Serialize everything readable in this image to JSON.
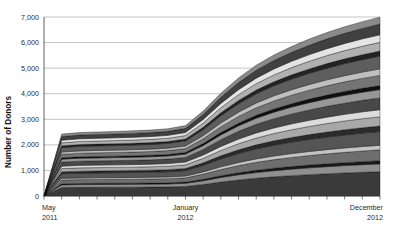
{
  "chart_data": {
    "type": "area",
    "title": "",
    "subtitle": "",
    "xlabel": "",
    "ylabel": "Number of Donors",
    "stacked": true,
    "grid": true,
    "legend": "none",
    "ylim": [
      0,
      7000
    ],
    "yticks": [
      0,
      1000,
      2000,
      3000,
      4000,
      5000,
      6000,
      7000
    ],
    "ytick_labels": [
      "0",
      "1,000",
      "2,000",
      "3,000",
      "4,000",
      "5,000",
      "6,000",
      "7,000"
    ],
    "x": [
      0,
      1,
      2,
      3,
      4,
      5,
      6,
      7,
      8,
      9,
      10,
      11,
      12,
      13,
      14,
      15,
      16,
      17,
      18,
      19
    ],
    "xtick_count": 20,
    "xtick_labels": [
      {
        "index": 0,
        "line1": "May",
        "line2": "2011"
      },
      {
        "index": 8,
        "line1": "January",
        "line2": "2012"
      },
      {
        "index": 19,
        "line1": "December",
        "line2": "2012"
      }
    ],
    "totals": [
      0,
      2320,
      2380,
      2400,
      2420,
      2440,
      2470,
      2520,
      2640,
      3180,
      3850,
      4420,
      4900,
      5280,
      5600,
      5880,
      6120,
      6340,
      6530,
      6700
    ],
    "series": [
      {
        "name": "series-01",
        "color": "#3a3a3a",
        "values": [
          0,
          330,
          338,
          341,
          344,
          347,
          351,
          358,
          375,
          452,
          547,
          628,
          696,
          750,
          796,
          835,
          870,
          901,
          928,
          952
        ]
      },
      {
        "name": "series-02",
        "color": "#8f8f8f",
        "values": [
          0,
          105,
          108,
          109,
          110,
          111,
          112,
          114,
          120,
          144,
          175,
          201,
          222,
          240,
          254,
          267,
          278,
          288,
          297,
          304
        ]
      },
      {
        "name": "series-03",
        "color": "#1a1a1a",
        "values": [
          0,
          42,
          43,
          44,
          44,
          44,
          45,
          46,
          48,
          58,
          70,
          80,
          89,
          96,
          102,
          107,
          111,
          115,
          119,
          122
        ]
      },
      {
        "name": "series-04",
        "color": "#6e6e6e",
        "values": [
          0,
          148,
          152,
          153,
          154,
          156,
          158,
          161,
          168,
          203,
          245,
          282,
          312,
          337,
          357,
          375,
          390,
          404,
          416,
          427
        ]
      },
      {
        "name": "series-05",
        "color": "#c4c4c4",
        "values": [
          0,
          62,
          63,
          64,
          65,
          65,
          66,
          67,
          70,
          85,
          103,
          118,
          131,
          141,
          150,
          157,
          164,
          170,
          175,
          179
        ]
      },
      {
        "name": "series-06",
        "color": "#555555",
        "values": [
          0,
          186,
          191,
          192,
          194,
          196,
          198,
          202,
          212,
          255,
          309,
          355,
          393,
          424,
          449,
          472,
          491,
          509,
          524,
          538
        ]
      },
      {
        "name": "series-07",
        "color": "#2b2b2b",
        "values": [
          0,
          74,
          76,
          77,
          77,
          78,
          79,
          81,
          84,
          102,
          123,
          141,
          157,
          169,
          179,
          188,
          196,
          203,
          209,
          214
        ]
      },
      {
        "name": "series-08",
        "color": "#a8a8a8",
        "values": [
          0,
          126,
          129,
          130,
          131,
          132,
          134,
          137,
          143,
          173,
          209,
          240,
          266,
          287,
          304,
          319,
          333,
          344,
          355,
          364
        ]
      },
      {
        "name": "series-09",
        "color": "#dcdcdc",
        "values": [
          0,
          95,
          98,
          98,
          99,
          100,
          101,
          103,
          108,
          130,
          158,
          181,
          201,
          216,
          230,
          241,
          251,
          260,
          268,
          275
        ]
      },
      {
        "name": "series-10",
        "color": "#484848",
        "values": [
          0,
          160,
          164,
          166,
          167,
          168,
          171,
          174,
          182,
          219,
          265,
          305,
          338,
          364,
          386,
          405,
          422,
          437,
          450,
          462
        ]
      },
      {
        "name": "series-11",
        "color": "#979797",
        "values": [
          0,
          112,
          115,
          116,
          117,
          118,
          119,
          122,
          128,
          154,
          186,
          214,
          237,
          255,
          271,
          284,
          296,
          307,
          316,
          324
        ]
      },
      {
        "name": "series-12",
        "color": "#111111",
        "values": [
          0,
          55,
          56,
          57,
          57,
          58,
          58,
          60,
          62,
          75,
          91,
          104,
          116,
          125,
          132,
          139,
          145,
          150,
          154,
          158
        ]
      },
      {
        "name": "series-13",
        "color": "#757575",
        "values": [
          0,
          138,
          141,
          143,
          144,
          145,
          147,
          150,
          157,
          189,
          229,
          263,
          291,
          314,
          333,
          349,
          364,
          377,
          388,
          398
        ]
      },
      {
        "name": "series-14",
        "color": "#bfbfbf",
        "values": [
          0,
          88,
          90,
          91,
          92,
          93,
          94,
          96,
          100,
          121,
          146,
          168,
          186,
          200,
          213,
          223,
          233,
          241,
          248,
          255
        ]
      },
      {
        "name": "series-15",
        "color": "#5e5e5e",
        "values": [
          0,
          172,
          177,
          178,
          180,
          181,
          183,
          187,
          196,
          236,
          286,
          328,
          364,
          392,
          416,
          437,
          455,
          471,
          485,
          498
        ]
      },
      {
        "name": "series-16",
        "color": "#232323",
        "values": [
          0,
          68,
          70,
          70,
          71,
          72,
          73,
          74,
          78,
          94,
          113,
          130,
          144,
          155,
          165,
          173,
          180,
          186,
          192,
          197
        ]
      },
      {
        "name": "series-17",
        "color": "#b0b0b0",
        "values": [
          0,
          118,
          121,
          122,
          123,
          124,
          126,
          128,
          134,
          162,
          196,
          225,
          250,
          269,
          285,
          299,
          312,
          323,
          333,
          341
        ]
      },
      {
        "name": "series-18",
        "color": "#e4e4e4",
        "values": [
          0,
          102,
          105,
          106,
          107,
          108,
          109,
          111,
          116,
          140,
          170,
          195,
          216,
          233,
          247,
          259,
          270,
          279,
          288,
          295
        ]
      },
      {
        "name": "series-19",
        "color": "#404040",
        "values": [
          0,
          145,
          149,
          150,
          151,
          153,
          155,
          158,
          165,
          199,
          241,
          277,
          307,
          331,
          351,
          368,
          384,
          397,
          409,
          420
        ]
      },
      {
        "name": "series-20",
        "color": "#8a8a8a",
        "values": [
          0,
          94,
          96,
          97,
          98,
          99,
          100,
          102,
          107,
          129,
          156,
          179,
          199,
          214,
          227,
          238,
          248,
          257,
          264,
          271
        ]
      }
    ]
  },
  "axis": {
    "ylabel": "Number of Donors"
  }
}
